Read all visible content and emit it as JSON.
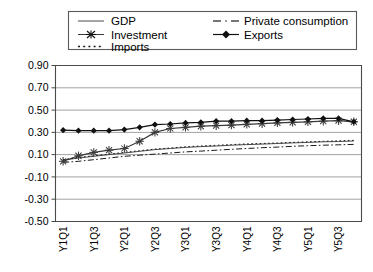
{
  "chart_data": {
    "type": "line",
    "title": "",
    "xlabel": "",
    "ylabel": "",
    "ylim": [
      -0.5,
      0.9
    ],
    "yticks": [
      "0.90",
      "0.70",
      "0.50",
      "0.30",
      "0.10",
      "-0.10",
      "-0.30",
      "-0.50"
    ],
    "ytick_values": [
      0.9,
      0.7,
      0.5,
      0.3,
      0.1,
      -0.1,
      -0.3,
      -0.5
    ],
    "grid": true,
    "legend_position": "top",
    "x": [
      "Y1Q1",
      "Y1Q2",
      "Y1Q3",
      "Y1Q4",
      "Y2Q1",
      "Y2Q2",
      "Y2Q3",
      "Y2Q4",
      "Y3Q1",
      "Y3Q2",
      "Y3Q3",
      "Y3Q4",
      "Y4Q1",
      "Y4Q2",
      "Y4Q3",
      "Y4Q4",
      "Y5Q1",
      "Y5Q2",
      "Y5Q3",
      "Y5Q4"
    ],
    "xticks_shown": [
      "Y1Q1",
      "Y1Q3",
      "Y2Q1",
      "Y2Q3",
      "Y3Q1",
      "Y3Q3",
      "Y4Q1",
      "Y4Q3",
      "Y5Q1",
      "Y5Q3"
    ],
    "series": [
      {
        "name": "GDP",
        "style": "solid",
        "marker": "none",
        "color": "#4d4d4d",
        "values": [
          0.05,
          0.07,
          0.085,
          0.1,
          0.115,
          0.13,
          0.145,
          0.155,
          0.165,
          0.172,
          0.178,
          0.185,
          0.19,
          0.195,
          0.2,
          0.205,
          0.21,
          0.215,
          0.218,
          0.222
        ]
      },
      {
        "name": "Private consumption",
        "style": "dashdot",
        "marker": "none",
        "color": "#1a1a1a",
        "values": [
          0.03,
          0.04,
          0.055,
          0.07,
          0.085,
          0.095,
          0.105,
          0.115,
          0.125,
          0.132,
          0.14,
          0.148,
          0.155,
          0.162,
          0.168,
          0.175,
          0.18,
          0.185,
          0.188,
          0.192
        ]
      },
      {
        "name": "Investment",
        "style": "solid",
        "marker": "star",
        "color": "#3a3a3a",
        "values": [
          0.04,
          0.09,
          0.12,
          0.14,
          0.155,
          0.22,
          0.3,
          0.335,
          0.345,
          0.355,
          0.36,
          0.365,
          0.372,
          0.378,
          0.385,
          0.39,
          0.395,
          0.4,
          0.405,
          0.395
        ]
      },
      {
        "name": "Imports",
        "style": "dotted",
        "marker": "none",
        "color": "#1a1a1a",
        "values": [
          0.055,
          0.075,
          0.09,
          0.105,
          0.12,
          0.135,
          0.15,
          0.16,
          0.17,
          0.178,
          0.184,
          0.19,
          0.196,
          0.2,
          0.205,
          0.21,
          0.215,
          0.22,
          0.224,
          0.228
        ]
      },
      {
        "name": "Exports",
        "style": "solid",
        "marker": "diamond",
        "color": "#111111",
        "values": [
          0.32,
          0.315,
          0.315,
          0.315,
          0.325,
          0.345,
          0.37,
          0.375,
          0.385,
          0.39,
          0.4,
          0.4,
          0.405,
          0.405,
          0.41,
          0.415,
          0.42,
          0.425,
          0.425,
          0.395
        ]
      }
    ]
  },
  "legend": {
    "entries": [
      {
        "label": "GDP"
      },
      {
        "label": "Private consumption"
      },
      {
        "label": "Investment"
      },
      {
        "label": "Exports"
      },
      {
        "label": "Imports"
      }
    ]
  }
}
